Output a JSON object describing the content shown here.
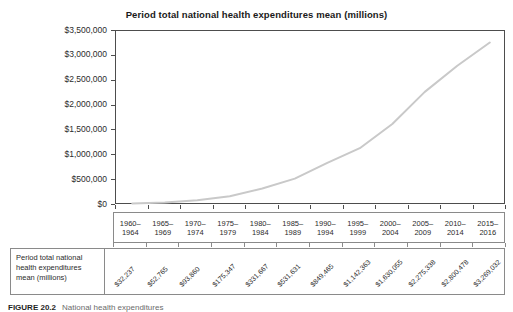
{
  "chart_data": {
    "type": "line",
    "title": "Period total national health expenditures mean (millions)",
    "categories": [
      "1960–1964",
      "1965–1969",
      "1970–1974",
      "1975–1979",
      "1980–1984",
      "1985–1989",
      "1990–1994",
      "1995–1999",
      "2000–2004",
      "2005–2009",
      "2010–2014",
      "2015–2016"
    ],
    "values": [
      32237,
      52765,
      93860,
      175347,
      331667,
      531631,
      849465,
      1142363,
      1630055,
      2275338,
      2800478,
      3269032
    ],
    "value_labels": [
      "$32,237",
      "$52,765",
      "$93,860",
      "$175,347",
      "$331,667",
      "$531,631",
      "$849,465",
      "$1,142,363",
      "$1,630,055",
      "$2,275,338",
      "$2,800,478",
      "$3,269,032"
    ],
    "y_tick_labels": [
      "$0",
      "$500,000",
      "$1,000,000",
      "$1,500,000",
      "$2,000,000",
      "$2,500,000",
      "$3,000,000",
      "$3,500,000"
    ],
    "ylim": [
      0,
      3500000
    ],
    "y_tick_step": 500000,
    "grid": false,
    "legend": "none",
    "line_color": "#c9c9c9",
    "xlabel": "",
    "ylabel": ""
  },
  "table": {
    "row_label": "Period total national health expenditures mean (millions)"
  },
  "caption": {
    "figure_number": "FIGURE 20.2",
    "text": "National health expenditures"
  }
}
